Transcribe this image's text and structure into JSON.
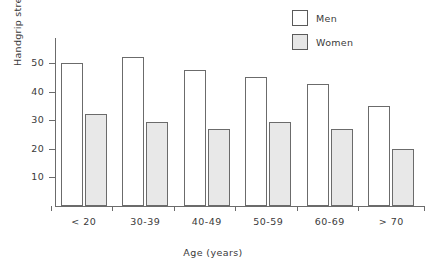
{
  "chart_data": {
    "type": "bar",
    "title": "",
    "subtitle": "",
    "xlabel": "Age (years)",
    "ylabel": "Handgrip strength (kg)",
    "categories": [
      "< 20",
      "30-39",
      "40-49",
      "50-59",
      "60-69",
      "> 70"
    ],
    "series": [
      {
        "name": "Men",
        "color": "#ffffff",
        "values": [
          50,
          52,
          47.5,
          45,
          42.5,
          35
        ]
      },
      {
        "name": "Women",
        "color": "#e8e8e8",
        "values": [
          32,
          29.5,
          27,
          29.5,
          27,
          20
        ]
      }
    ],
    "ylim": [
      0,
      56
    ],
    "yticks": [
      10,
      20,
      30,
      40,
      50
    ],
    "ytick_labels": [
      "10",
      "20",
      "30",
      "40",
      "50"
    ],
    "grid": false,
    "legend_position": "top-right",
    "legend_entries": [
      "Men",
      "Women"
    ]
  },
  "legend": {
    "men_label": "Men",
    "women_label": "Women"
  },
  "axes": {
    "x_title": "Age (years)",
    "y_title": "Handgrip strength (kg)"
  }
}
